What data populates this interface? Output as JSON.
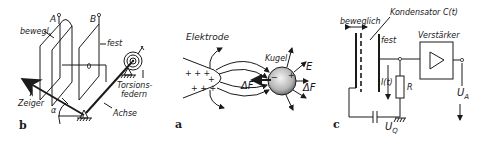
{
  "figure": {
    "colors": {
      "ink": "#1a1a1a",
      "background": "#ffffff",
      "hatch": "#777777"
    },
    "panel_b": {
      "panel_label": "b",
      "labels": {
        "plate_a": "A",
        "plate_b": "B",
        "movable": "bewegl.",
        "fixed": "fest",
        "pointer": "Zeiger",
        "angle": "α",
        "torsion_springs_line1": "Torsions-",
        "torsion_springs_line2": "federn",
        "axis": "Achse"
      }
    },
    "panel_a": {
      "panel_label": "a",
      "labels": {
        "electrode": "Elektrode",
        "sphere": "Kugel",
        "field": "E",
        "force_left": "ΔF",
        "force_right": "ΔF",
        "plus_charges": "+ + + + + +",
        "minus_charges": "− − −"
      }
    },
    "panel_c": {
      "panel_label": "c",
      "labels": {
        "movable": "beweglich",
        "capacitor": "Kondensator C(t)",
        "fixed": "fest",
        "amplifier": "Verstärker",
        "current": "I(t)",
        "resistor": "R",
        "output_voltage": "U",
        "output_voltage_sub": "A",
        "source_voltage": "U",
        "source_voltage_sub": "Q"
      }
    }
  }
}
